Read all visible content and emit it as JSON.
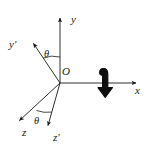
{
  "figure": {
    "type": "coordinate-axes-rotation-diagram",
    "background_color": "#ffffff",
    "stroke_color": "#1a1a1a",
    "width": 148,
    "height": 149,
    "origin": {
      "label": "O",
      "x": 60,
      "y": 83
    },
    "axes": [
      {
        "name": "y-axis",
        "label": "y",
        "label_x": 74,
        "label_y": 22,
        "from": [
          60,
          83
        ],
        "to": [
          60,
          16
        ],
        "arrow": "up",
        "style": "thin-line"
      },
      {
        "name": "x-axis",
        "label": "x",
        "label_x": 137,
        "label_y": 92,
        "from": [
          60,
          83
        ],
        "to": [
          138,
          83
        ],
        "arrow": "right",
        "style": "thin-line"
      },
      {
        "name": "z-axis",
        "label": "z",
        "label_x": 25,
        "label_y": 133,
        "from": [
          60,
          83
        ],
        "to": [
          18,
          122
        ],
        "arrow": "down-left",
        "style": "thin-line"
      },
      {
        "name": "y-prime-axis",
        "label": "y′",
        "label_x": 12,
        "label_y": 46,
        "from": [
          60,
          83
        ],
        "to": [
          32,
          42
        ],
        "arrow": "up-left",
        "style": "thin-line"
      },
      {
        "name": "z-prime-axis",
        "label": "z′",
        "label_x": 55,
        "label_y": 138,
        "from": [
          60,
          83
        ],
        "to": [
          47,
          128
        ],
        "arrow": "down",
        "style": "thin-line"
      }
    ],
    "angles": [
      {
        "name": "theta-upper",
        "label": "θ",
        "label_x": 47,
        "label_y": 54,
        "between": [
          "y-prime-axis",
          "y-axis"
        ],
        "arc_radius": 26
      },
      {
        "name": "theta-lower",
        "label": "θ",
        "label_x": 37,
        "label_y": 121,
        "between": [
          "z-axis",
          "z-prime-axis"
        ],
        "arc_radius": 30
      }
    ],
    "rotation_arrow": {
      "name": "rotation-arrow",
      "description": "thick hooked rotation arrow crossing the x-axis, pointing downward",
      "x": 105,
      "y": 83,
      "direction": "down",
      "color": "#0d0d0d"
    }
  }
}
